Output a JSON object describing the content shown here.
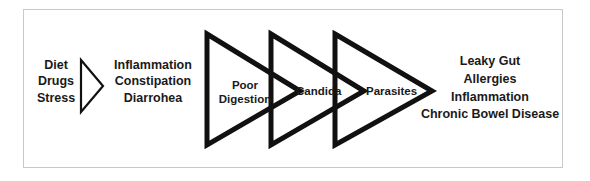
{
  "diagram": {
    "type": "flow-diagram",
    "background_color": "#ffffff",
    "frame_border_color": "#c9c9c9",
    "stroke_color": "#111111",
    "text_color": "#1a1a1a",
    "causes": {
      "name": "causes-block",
      "lines": [
        "Diet",
        "Drugs",
        "Stress"
      ]
    },
    "arrow": {
      "name": "small-right-arrow",
      "direction": "right"
    },
    "symptoms": {
      "name": "symptoms-block",
      "lines": [
        "Inflammation",
        "Constipation",
        "Diarrohea"
      ]
    },
    "stages": [
      {
        "name": "poor-digestion",
        "lines": [
          "Poor",
          "Digestion"
        ],
        "label": "Poor Digestion"
      },
      {
        "name": "candida",
        "lines": [
          "Candida"
        ],
        "label": "Candida"
      },
      {
        "name": "parasites",
        "lines": [
          "Parasites"
        ],
        "label": "Parasites"
      }
    ],
    "outcomes": {
      "name": "outcomes-block",
      "lines": [
        "Leaky Gut",
        "Allergies",
        "Inflammation",
        "Chronic Bowel Disease"
      ]
    }
  }
}
